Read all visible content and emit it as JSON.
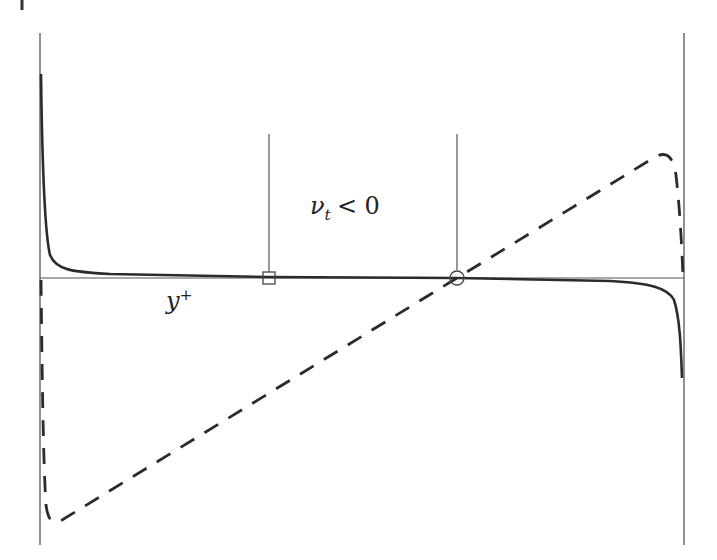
{
  "figure": {
    "annotations": {
      "nu_symbol": "ν",
      "nu_subscript": "t",
      "nu_relation": "< 0",
      "y_symbol": "y",
      "y_superscript": "+"
    },
    "markers": [
      {
        "shape": "square",
        "x": 269,
        "y": 278
      },
      {
        "shape": "circle",
        "x": 457,
        "y": 278
      }
    ],
    "colors": {
      "axis": "#555555",
      "solid_curve": "#2b2b2b",
      "dashed_curve": "#2b2b2b",
      "background": "#ffffff"
    }
  }
}
